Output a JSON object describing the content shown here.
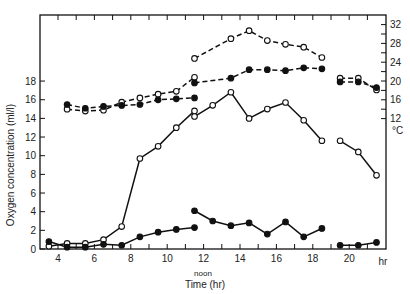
{
  "chart_data": {
    "type": "line",
    "title": "",
    "xlabel": "Time (hr)",
    "x_sublabel": "noon",
    "ylabel": "Oxygen concentration (ml/l)",
    "y2label": "°C",
    "xlim": [
      3,
      22
    ],
    "ylim": [
      0,
      25
    ],
    "y2lim": [
      12,
      33
    ],
    "x_ticks": [
      4,
      6,
      8,
      10,
      12,
      14,
      16,
      18,
      20
    ],
    "x_tick_labels": [
      "4",
      "6",
      "8",
      "10",
      "12",
      "14",
      "16",
      "18",
      "20",
      "hr"
    ],
    "y_ticks": [
      0,
      2,
      4,
      6,
      8,
      10,
      12,
      14,
      16,
      18
    ],
    "y2_ticks": [
      12,
      16,
      20,
      24,
      28,
      32
    ],
    "grid": false,
    "series": [
      {
        "name": "oxygen-open-solid",
        "axis": "left",
        "marker": "open-circle",
        "line": "solid",
        "segments": [
          {
            "x": [
              3.5,
              4.5,
              5.5,
              6.5,
              7.5,
              8.5,
              9.5,
              10.5,
              11.5
            ],
            "y": [
              0.3,
              0.6,
              0.6,
              1.0,
              2.4,
              9.7,
              11.0,
              13.0,
              14.8
            ]
          },
          {
            "x": [
              11.5,
              12.5,
              13.5,
              14.5,
              15.5,
              16.5,
              17.5,
              18.5
            ],
            "y": [
              14.2,
              15.4,
              16.8,
              14.0,
              15.0,
              15.7,
              13.8,
              11.6
            ]
          },
          {
            "x": [
              19.5,
              20.5,
              21.5
            ],
            "y": [
              11.6,
              10.4,
              7.9
            ]
          }
        ]
      },
      {
        "name": "oxygen-filled-solid",
        "axis": "left",
        "marker": "filled-circle",
        "line": "solid",
        "segments": [
          {
            "x": [
              3.5,
              4.5,
              5.5,
              6.5,
              7.5,
              8.5,
              9.5,
              10.5,
              11.5
            ],
            "y": [
              0.8,
              0.2,
              0.2,
              0.5,
              0.4,
              1.3,
              1.8,
              2.1,
              2.3
            ]
          },
          {
            "x": [
              11.5,
              12.5,
              13.5,
              14.5,
              15.5,
              16.5,
              17.5,
              18.5
            ],
            "y": [
              4.1,
              3.0,
              2.5,
              2.8,
              1.6,
              2.9,
              1.3,
              2.2
            ]
          },
          {
            "x": [
              19.5,
              20.5,
              21.5
            ],
            "y": [
              0.4,
              0.4,
              0.7
            ]
          }
        ]
      },
      {
        "name": "temperature-open-dashed",
        "axis": "right",
        "marker": "open-circle",
        "line": "dashed",
        "segments": [
          {
            "x": [
              4.5,
              5.5,
              6.5,
              7.5,
              8.5,
              9.5,
              10.5,
              11.5
            ],
            "y": [
              14.0,
              13.6,
              13.8,
              15.5,
              16.4,
              17.2,
              17.8,
              20.8
            ]
          },
          {
            "x": [
              11.5,
              13.5,
              14.5,
              15.5,
              16.5,
              17.5,
              18.5
            ],
            "y": [
              24.8,
              29.0,
              30.7,
              28.6,
              27.8,
              27.2,
              25.0
            ]
          },
          {
            "x": [
              19.5,
              20.5,
              21.5
            ],
            "y": [
              20.6,
              20.6,
              18.1
            ]
          }
        ]
      },
      {
        "name": "temperature-filled-dashed",
        "axis": "right",
        "marker": "filled-circle",
        "line": "dashed",
        "segments": [
          {
            "x": [
              4.5,
              5.5,
              6.5,
              7.5,
              8.5,
              9.5,
              10.5,
              11.5
            ],
            "y": [
              15.0,
              14.2,
              14.6,
              14.8,
              15.0,
              16.0,
              16.2,
              16.4
            ]
          },
          {
            "x": [
              11.5,
              13.5,
              14.5,
              15.5,
              16.5,
              17.5,
              18.5
            ],
            "y": [
              19.6,
              20.6,
              22.4,
              22.4,
              22.2,
              22.8,
              22.6
            ]
          },
          {
            "x": [
              19.5,
              20.5,
              21.5
            ],
            "y": [
              19.8,
              19.8,
              18.6
            ]
          }
        ]
      }
    ]
  },
  "labels": {
    "ylabel": "Oxygen concentration (ml/l)",
    "xlabel": "Time (hr)",
    "noon": "noon",
    "deg": "°C",
    "hr": "hr"
  }
}
